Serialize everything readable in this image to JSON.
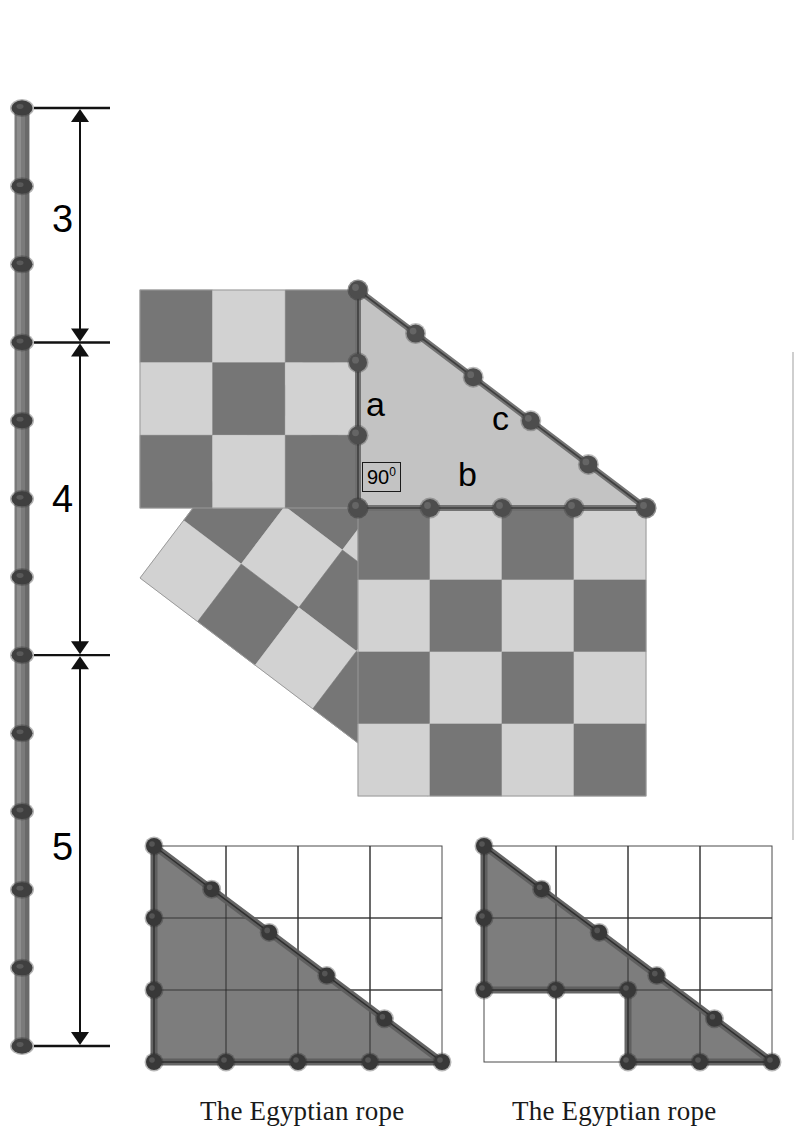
{
  "figure": {
    "title_hidden": "Egyptian rope Pythagorean theorem figure",
    "colors": {
      "checker_dark": "#767676",
      "checker_light": "#d2d2d2",
      "triangle_fill": "#c3c3c3",
      "rope": "#6e6e6e",
      "knot": "#4a4a4a",
      "grid_line": "#3a3a3a",
      "outline": "#2b2b2b",
      "grid_poly_fill": "#7d7d7d",
      "background": "#ffffff",
      "ink": "#000000"
    }
  },
  "rope_ruler": {
    "name": "knotted-rope-ruler",
    "total_knots": 13,
    "total_segments": 12,
    "segment_labels": [
      "3",
      "4",
      "5"
    ],
    "dimensions": [
      {
        "label": "3",
        "segments": 3
      },
      {
        "label": "4",
        "segments": 4
      },
      {
        "label": "5",
        "segments": 5
      }
    ]
  },
  "triangle": {
    "name": "pythagorean-triangle",
    "side_a_label": "a",
    "side_b_label": "b",
    "side_c_label": "c",
    "right_angle_value": "90",
    "right_angle_degree_symbol": "0",
    "side_a_length": 3,
    "side_b_length": 4,
    "side_c_length": 5
  },
  "squares": {
    "square_a": {
      "name": "square-on-side-a",
      "size": 3,
      "label": "a"
    },
    "square_b": {
      "name": "square-on-side-b",
      "size": 4,
      "label": "b"
    },
    "square_c": {
      "name": "square-on-hypotenuse-c",
      "size": 5,
      "label": "c"
    }
  },
  "bottom_panels": [
    {
      "name": "egyptian-rope-triangle-panel",
      "caption": "The Egyptian rope",
      "grid_cols": 4,
      "grid_rows": 3,
      "shape": "right-triangle",
      "knots": 12
    },
    {
      "name": "egyptian-rope-lshape-panel",
      "caption": "The Egyptian rope",
      "grid_cols": 4,
      "grid_rows": 3,
      "shape": "l-shaped-polygon",
      "knots": 12
    }
  ],
  "chart_data": {
    "type": "diagram",
    "relation": "a² + b² = c²",
    "values": {
      "a": 3,
      "b": 4,
      "c": 5
    },
    "areas": {
      "a_squared": 9,
      "b_squared": 16,
      "c_squared": 25
    },
    "annotations": [
      "3",
      "4",
      "5",
      "a",
      "b",
      "c",
      "90"
    ]
  }
}
